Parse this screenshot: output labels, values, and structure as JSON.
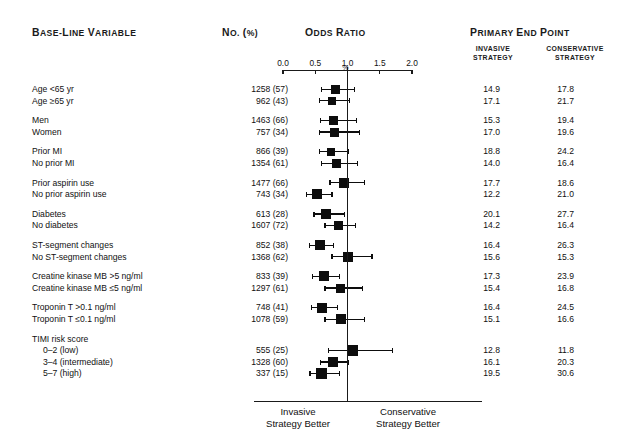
{
  "figure": {
    "headers": {
      "baseline_variable": "Base-Line Variable",
      "no_pct": "No. (%)",
      "odds_ratio": "Odds Ratio",
      "primary_end_point": "Primary End Point",
      "invasive_strategy_l1": "INVASIVE",
      "invasive_strategy_l2": "STRATEGY",
      "conservative_strategy_l1": "CONSERVATIVE",
      "conservative_strategy_l2": "STRATEGY",
      "percent_symbol": "%"
    },
    "axis": {
      "tick_labels": [
        "0.0",
        "0.5",
        "1.0",
        "1.5",
        "2.0"
      ],
      "tick_values": [
        0.0,
        0.5,
        1.0,
        1.5,
        2.0
      ],
      "min": 0.0,
      "max": 2.0,
      "reference_line": 1.0
    },
    "footer": {
      "left_l1": "Invasive",
      "left_l2": "Strategy Better",
      "right_l1": "Conservative",
      "right_l2": "Strategy Better"
    }
  },
  "chart_data": {
    "type": "scatter",
    "title": "Odds Ratio",
    "xlabel": "Odds Ratio",
    "ylabel": "Base-Line Variable",
    "xlim": [
      0.0,
      2.0
    ],
    "xticks": [
      0.0,
      0.5,
      1.0,
      1.5,
      2.0
    ],
    "grid": false,
    "legend": null,
    "reference_line": 1.0,
    "annotations": [
      "Invasive Strategy Better",
      "Conservative Strategy Better"
    ],
    "columns": [
      "Base-Line Variable",
      "No. (%)",
      "Odds Ratio",
      "Invasive Strategy %",
      "Conservative Strategy %"
    ],
    "groups": [
      {
        "name": "Age",
        "rows": [
          {
            "label": "Age <65 yr",
            "no_pct": "1258 (57)",
            "or": 0.82,
            "ci_low": 0.6,
            "ci_high": 1.11,
            "invasive": "14.9",
            "conservative": "17.8",
            "box": 9,
            "indent": false
          },
          {
            "label": "Age ≥65 yr",
            "no_pct": "962 (43)",
            "or": 0.76,
            "ci_low": 0.57,
            "ci_high": 1.03,
            "invasive": "17.1",
            "conservative": "21.7",
            "box": 8,
            "indent": false
          }
        ]
      },
      {
        "name": "Sex",
        "rows": [
          {
            "label": "Men",
            "no_pct": "1463 (66)",
            "or": 0.79,
            "ci_low": 0.58,
            "ci_high": 1.14,
            "invasive": "15.3",
            "conservative": "19.4",
            "box": 9,
            "indent": false
          },
          {
            "label": "Women",
            "no_pct": "757 (34)",
            "or": 0.8,
            "ci_low": 0.57,
            "ci_high": 1.19,
            "invasive": "17.0",
            "conservative": "19.6",
            "box": 9,
            "indent": false
          }
        ]
      },
      {
        "name": "Prior MI",
        "rows": [
          {
            "label": "Prior MI",
            "no_pct": "866 (39)",
            "or": 0.75,
            "ci_low": 0.56,
            "ci_high": 1.02,
            "invasive": "18.8",
            "conservative": "24.2",
            "box": 8,
            "indent": false
          },
          {
            "label": "No prior MI",
            "no_pct": "1354 (61)",
            "or": 0.83,
            "ci_low": 0.6,
            "ci_high": 1.16,
            "invasive": "14.0",
            "conservative": "16.4",
            "box": 9,
            "indent": false
          }
        ]
      },
      {
        "name": "Prior aspirin use",
        "rows": [
          {
            "label": "Prior aspirin use",
            "no_pct": "1477 (66)",
            "or": 0.95,
            "ci_low": 0.73,
            "ci_high": 1.26,
            "invasive": "17.7",
            "conservative": "18.6",
            "box": 10,
            "indent": false
          },
          {
            "label": "No prior aspirin use",
            "no_pct": "743 (34)",
            "or": 0.53,
            "ci_low": 0.37,
            "ci_high": 0.76,
            "invasive": "12.2",
            "conservative": "21.0",
            "box": 10,
            "indent": false
          }
        ]
      },
      {
        "name": "Diabetes",
        "rows": [
          {
            "label": "Diabetes",
            "no_pct": "613 (28)",
            "or": 0.67,
            "ci_low": 0.48,
            "ci_high": 0.95,
            "invasive": "20.1",
            "conservative": "27.7",
            "box": 10,
            "indent": false
          },
          {
            "label": "No diabetes",
            "no_pct": "1607 (72)",
            "or": 0.86,
            "ci_low": 0.65,
            "ci_high": 1.13,
            "invasive": "14.2",
            "conservative": "16.4",
            "box": 9,
            "indent": false
          }
        ]
      },
      {
        "name": "ST-segment changes",
        "rows": [
          {
            "label": "ST-segment changes",
            "no_pct": "852 (38)",
            "or": 0.57,
            "ci_low": 0.41,
            "ci_high": 0.78,
            "invasive": "16.4",
            "conservative": "26.3",
            "box": 10,
            "indent": false
          },
          {
            "label": "No ST-segment changes",
            "no_pct": "1368 (62)",
            "or": 1.01,
            "ci_low": 0.76,
            "ci_high": 1.38,
            "invasive": "15.6",
            "conservative": "15.3",
            "box": 10,
            "indent": false
          }
        ]
      },
      {
        "name": "Creatine kinase MB",
        "rows": [
          {
            "label": "Creatine kinase MB >5 ng/ml",
            "no_pct": "833 (39)",
            "or": 0.64,
            "ci_low": 0.46,
            "ci_high": 0.88,
            "invasive": "17.3",
            "conservative": "23.9",
            "box": 10,
            "indent": false
          },
          {
            "label": "Creatine kinase MB ≤5 ng/ml",
            "no_pct": "1297 (61)",
            "or": 0.89,
            "ci_low": 0.65,
            "ci_high": 1.23,
            "invasive": "15.4",
            "conservative": "16.8",
            "box": 9,
            "indent": false
          }
        ]
      },
      {
        "name": "Troponin T",
        "rows": [
          {
            "label": "Troponin T >0.1 ng/ml",
            "no_pct": "748 (41)",
            "or": 0.61,
            "ci_low": 0.44,
            "ci_high": 0.85,
            "invasive": "16.4",
            "conservative": "24.5",
            "box": 10,
            "indent": false
          },
          {
            "label": "Troponin T ≤0.1 ng/ml",
            "no_pct": "1078 (59)",
            "or": 0.9,
            "ci_low": 0.65,
            "ci_high": 1.26,
            "invasive": "15.1",
            "conservative": "16.6",
            "box": 10,
            "indent": false
          }
        ]
      },
      {
        "name": "TIMI risk score",
        "header": "TIMI risk score",
        "rows": [
          {
            "label": "0–2 (low)",
            "no_pct": "555 (25)",
            "or": 1.08,
            "ci_low": 0.7,
            "ci_high": 1.7,
            "invasive": "12.8",
            "conservative": "11.8",
            "box": 11,
            "indent": true
          },
          {
            "label": "3–4 (intermediate)",
            "no_pct": "1328 (60)",
            "or": 0.77,
            "ci_low": 0.58,
            "ci_high": 1.02,
            "invasive": "16.1",
            "conservative": "20.3",
            "box": 10,
            "indent": true
          },
          {
            "label": "5–7 (high)",
            "no_pct": "337 (15)",
            "or": 0.6,
            "ci_low": 0.42,
            "ci_high": 0.87,
            "invasive": "19.5",
            "conservative": "30.6",
            "box": 11,
            "indent": true
          }
        ]
      }
    ]
  }
}
